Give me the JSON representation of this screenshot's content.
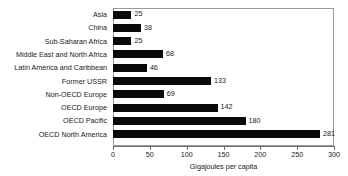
{
  "chart_data": {
    "type": "bar",
    "orientation": "horizontal",
    "title": "",
    "subtitle": "",
    "xlabel": "Gigajoules per capita",
    "ylabel": "",
    "xlim": [
      0,
      300
    ],
    "ylim": null,
    "xticks": [
      0,
      50,
      100,
      150,
      200,
      250,
      300
    ],
    "xtick_labels": [
      "0",
      "50",
      "100",
      "150",
      "200",
      "250",
      "300"
    ],
    "grid": false,
    "legend": null,
    "bar_color": "#0a0a0a",
    "frame_color": "#9a9a9a",
    "categories": [
      "Asia",
      "China",
      "Sub-Saharan Africa",
      "Middle East and North Africa",
      "Latin America and Caribbean",
      "Former USSR",
      "Non-OECD Europe",
      "OECD Europe",
      "OECD Pacific",
      "OECD North America"
    ],
    "values": [
      25,
      38,
      25,
      68,
      46,
      133,
      69,
      142,
      180,
      281
    ],
    "value_labels": [
      "25",
      "38",
      "25",
      "68",
      "46",
      "133",
      "69",
      "142",
      "180",
      "281"
    ]
  }
}
